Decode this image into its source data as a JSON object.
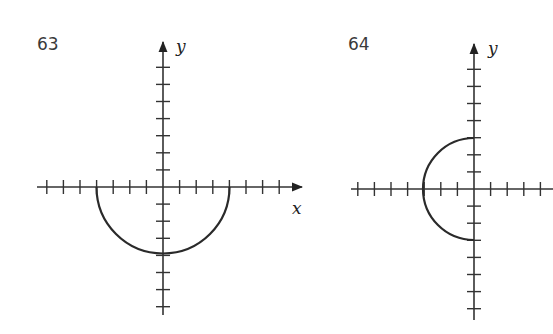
{
  "chart_data": [
    {
      "type": "line",
      "title": "63",
      "xlabel": "x",
      "ylabel": "y",
      "xlim": [
        -7,
        7
      ],
      "ylim": [
        -7,
        7
      ],
      "grid": false,
      "tick_step": 1,
      "curve": "lower semicircle",
      "equation": "y = -sqrt(16 - x^2)",
      "center": [
        0,
        0
      ],
      "radius": 4,
      "endpoints": [
        [
          -4,
          0
        ],
        [
          4,
          0
        ]
      ],
      "vertex": [
        0,
        -4
      ]
    },
    {
      "type": "line",
      "title": "64",
      "xlabel": "",
      "ylabel": "y",
      "xlim": [
        -7,
        4
      ],
      "ylim": [
        -7,
        7
      ],
      "grid": false,
      "tick_step": 1,
      "curve": "left semicircle",
      "equation": "x = -sqrt(9 - y^2)",
      "center": [
        0,
        0
      ],
      "radius": 3,
      "endpoints": [
        [
          0,
          3
        ],
        [
          0,
          -3
        ]
      ],
      "vertex": [
        -3,
        0
      ]
    }
  ],
  "panels": [
    {
      "number": "63",
      "x_label": "x",
      "y_label": "y"
    },
    {
      "number": "64",
      "y_label": "y"
    }
  ],
  "colors": {
    "axis": "#333333",
    "curve": "#2a2a2a",
    "label": "#3a3a3a"
  }
}
